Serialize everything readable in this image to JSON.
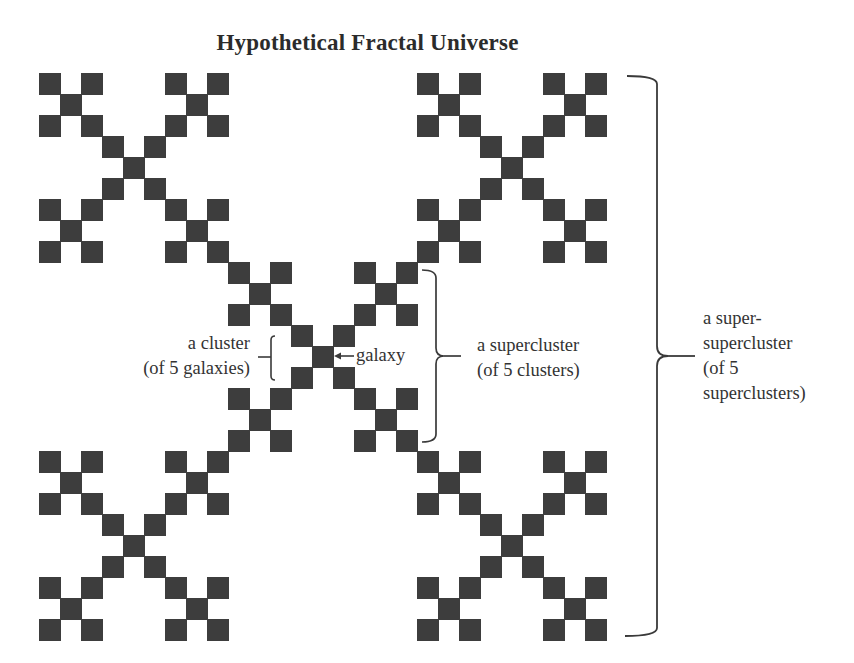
{
  "title": "Hypothetical Fractal Universe",
  "colors": {
    "galaxy_fill": "#3d3d3d",
    "bracket_stroke": "#3a3a3a",
    "text": "#333333",
    "background": "#ffffff"
  },
  "fractal": {
    "type": "Vicsek X-fractal",
    "level": 3,
    "grid_size": 27,
    "origin_x": 39,
    "origin_y": 73,
    "cell_step": 21,
    "cell_size": 22
  },
  "annotations": {
    "galaxy": {
      "label": "galaxy"
    },
    "cluster": {
      "line1": "a cluster",
      "line2": "(of 5 galaxies)"
    },
    "supercluster": {
      "line1": "a supercluster",
      "line2": "(of 5 clusters)"
    },
    "super_supercluster": {
      "line1": "a super-",
      "line2": "supercluster",
      "line3": "(of 5",
      "line4": "superclusters)"
    }
  }
}
